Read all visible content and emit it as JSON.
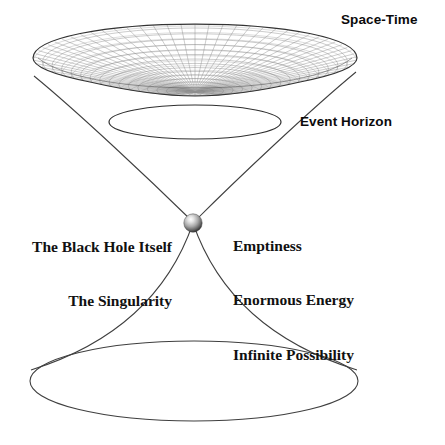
{
  "diagram": {
    "background_color": "#ffffff",
    "line_color": "#3a3a3a",
    "mesh_color": "#6e6e6e",
    "text_color": "#111111"
  },
  "labels": {
    "space_time": "Space-Time",
    "event_horizon": "Event Horizon",
    "black_hole_line1": "The Black Hole Itself",
    "black_hole_line2": "The Singularity",
    "property_line1": "Emptiness",
    "property_line2": "Enormous Energy",
    "property_line3": "Infinite Possibility"
  },
  "chart_data": {
    "type": "diagram",
    "elements": [
      {
        "name": "space-time-disk",
        "shape": "meshed lens / flattened ellipsoid",
        "center": [
          195,
          60
        ],
        "rx": 162,
        "ry": 36,
        "label": "Space-Time",
        "mesh": {
          "radial_lines": 72,
          "concentric_lines": 17
        }
      },
      {
        "name": "event-horizon-ellipse",
        "shape": "ellipse",
        "center": [
          195,
          122
        ],
        "rx": 86,
        "ry": 17,
        "label": "Event Horizon"
      },
      {
        "name": "singularity-sphere",
        "shape": "shaded sphere",
        "center": [
          193,
          223
        ],
        "radius": 9,
        "label": "The Singularity"
      },
      {
        "name": "lower-cone-ellipse",
        "shape": "ellipse",
        "center": [
          194,
          381
        ],
        "rx": 164,
        "ry": 40
      },
      {
        "name": "upper-cone",
        "shape": "hyperbolic funnel narrowing from disk rim to singularity",
        "from_y": 76,
        "to_y": 223
      },
      {
        "name": "lower-cone",
        "shape": "hyperbolic funnel widening from singularity to base ellipse",
        "from_y": 223,
        "to_y": 381
      }
    ],
    "annotations": [
      {
        "text": "Space-Time",
        "position": [
          341,
          12
        ],
        "style": "bold sans-serif"
      },
      {
        "text": "Event Horizon",
        "position": [
          300,
          114
        ],
        "style": "bold sans-serif"
      },
      {
        "text": "The Black Hole Itself",
        "position": [
          172,
          201
        ],
        "style": "bold serif",
        "align": "right"
      },
      {
        "text": "The Singularity",
        "position": [
          172,
          219
        ],
        "style": "bold serif",
        "align": "right"
      },
      {
        "text": "Emptiness",
        "position": [
          233,
          200
        ],
        "style": "bold serif",
        "align": "left"
      },
      {
        "text": "Enormous Energy",
        "position": [
          233,
          218
        ],
        "style": "bold serif",
        "align": "left"
      },
      {
        "text": "Infinite Possibility",
        "position": [
          233,
          236
        ],
        "style": "bold serif",
        "align": "left"
      }
    ]
  }
}
